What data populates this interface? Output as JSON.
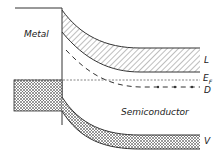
{
  "diagram": {
    "type": "metal-semiconductor band diagram",
    "regions": {
      "metal": "Metal",
      "semiconductor": "Semiconductor"
    },
    "band_labels": {
      "conduction": "L",
      "fermi_main": "E",
      "fermi_sub": "F",
      "donor": "D",
      "valence": "V"
    },
    "colors": {
      "line": "#333333",
      "background": "#ffffff"
    }
  }
}
